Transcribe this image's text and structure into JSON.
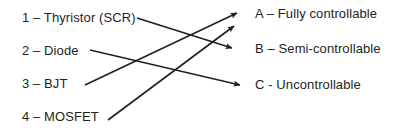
{
  "diagram": {
    "line_color": "#231f20",
    "text_color": "#231f20",
    "background": "#ffffff",
    "left_items": [
      {
        "id": "1",
        "label": "1 – Thyristor (SCR)"
      },
      {
        "id": "2",
        "label": "2 – Diode"
      },
      {
        "id": "3",
        "label": "3 – BJT"
      },
      {
        "id": "4",
        "label": "4 – MOSFET"
      }
    ],
    "right_items": [
      {
        "id": "A",
        "label": "A – Fully controllable"
      },
      {
        "id": "B",
        "label": "B – Semi-controllable"
      },
      {
        "id": "C",
        "label": "C - Uncontrollable"
      }
    ],
    "connections": [
      {
        "from": "1",
        "to": "B",
        "x1": 137,
        "y1": 18,
        "x2": 232,
        "y2": 48
      },
      {
        "from": "2",
        "to": "C",
        "x1": 90,
        "y1": 50,
        "x2": 240,
        "y2": 85
      },
      {
        "from": "3",
        "to": "A",
        "x1": 85,
        "y1": 85,
        "x2": 237,
        "y2": 13
      },
      {
        "from": "4",
        "to": "A",
        "x1": 108,
        "y1": 120,
        "x2": 234,
        "y2": 26
      }
    ]
  }
}
